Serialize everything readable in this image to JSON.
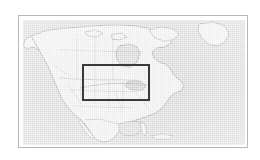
{
  "figure": {
    "kind": "map-thumbnail",
    "background_color": "#ffffff"
  },
  "frame": {
    "name": "map-frame",
    "border_color": "#b9b9b9",
    "left": 18,
    "top": 15,
    "width": 230,
    "height": 133
  },
  "map": {
    "region": "North America",
    "projection_note": "equirectangular locator view",
    "ocean_color": "#d9d9d9",
    "land_color": "#f1f1f1",
    "coastline_color": "#8d8d8d",
    "border_color": "#a6a6a6",
    "labels": []
  },
  "roi": {
    "name": "study-area-box",
    "label": "",
    "stroke_color": "#3a3a3a",
    "stroke_width": 2,
    "left": 59,
    "top": 44,
    "width": 68,
    "height": 37
  },
  "track": {
    "name": "transect-line",
    "style": "dotted",
    "color": "#9a9a9a",
    "label": ""
  }
}
